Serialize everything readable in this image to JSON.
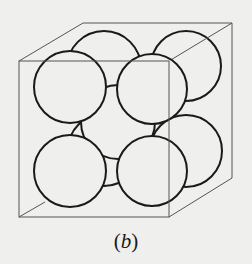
{
  "figure": {
    "caption_open": "(",
    "caption_label": "b",
    "caption_close": ")",
    "colors": {
      "background": "#efefed",
      "sphere_stroke": "#1a1a1a",
      "sphere_fill": "#efefed",
      "cube_edge": "#555555"
    }
  }
}
